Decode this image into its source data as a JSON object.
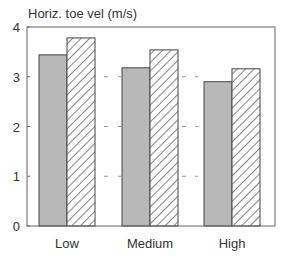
{
  "chart_data": {
    "type": "bar",
    "title": "Horiz. toe vel (m/s)",
    "xlabel": "",
    "ylabel": "Horiz. toe vel (m/s)",
    "categories": [
      "Low",
      "Medium",
      "High"
    ],
    "series": [
      {
        "name": "Series 1 (gray fill)",
        "values": [
          3.44,
          3.18,
          2.9
        ],
        "fill": "#b8b8b8"
      },
      {
        "name": "Series 2 (hatched)",
        "values": [
          3.78,
          3.54,
          3.16
        ],
        "fill": "hatch"
      }
    ],
    "ylim": [
      0,
      4
    ],
    "yticks": [
      0,
      1,
      2,
      3,
      4
    ],
    "grid": "dashed horizontal marks at 1, 2, 3 between groups",
    "legend": null
  },
  "colors": {
    "gray_bar": "#b8b8b8",
    "axis": "#555555",
    "text": "#333333"
  }
}
